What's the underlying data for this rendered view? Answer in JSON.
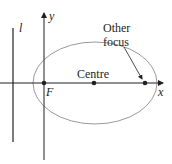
{
  "diagram": {
    "type": "ellipse-focus-directrix",
    "labels": {
      "directrix": "l",
      "y_axis": "y",
      "x_axis": "x",
      "focus": "F",
      "centre": "Centre",
      "other_focus_line1": "Other",
      "other_focus_line2": "focus"
    },
    "colors": {
      "axis": "#231f20",
      "ellipse": "#9a9a9a",
      "text": "#231f20"
    },
    "points": {
      "focus": {
        "x": 44,
        "y": 83
      },
      "centre": {
        "x": 94,
        "y": 83
      },
      "other_focus": {
        "x": 145,
        "y": 83
      }
    }
  }
}
